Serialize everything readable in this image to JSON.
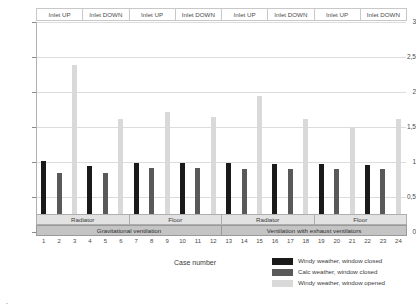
{
  "chart_data": {
    "type": "bar",
    "title": "",
    "xlabel": "Case number",
    "ylabel": "ε̄r [-]",
    "ylim": [
      0,
      3
    ],
    "ytick_labels": [
      "0",
      "0,5",
      "1",
      "1,5",
      "2",
      "2,5",
      "3"
    ],
    "ytick_values": [
      0,
      0.5,
      1,
      1.5,
      2,
      2.5,
      3
    ],
    "grid": true,
    "legend_position": "bottom-right",
    "categories": [
      "1",
      "2",
      "3",
      "4",
      "5",
      "6",
      "7",
      "8",
      "9",
      "10",
      "11",
      "12",
      "13",
      "14",
      "15",
      "16",
      "17",
      "18",
      "19",
      "20",
      "21",
      "22",
      "23",
      "24"
    ],
    "series": [
      {
        "name": "Windy weather, window closed",
        "color": "#1a1a1a",
        "values": [
          1.02,
          null,
          null,
          0.95,
          null,
          null,
          0.98,
          null,
          null,
          0.99,
          null,
          null,
          0.98,
          null,
          null,
          0.97,
          null,
          null,
          0.97,
          null,
          null,
          0.96,
          null,
          null
        ]
      },
      {
        "name": "Calc weather, window closed",
        "color": "#595959",
        "values": [
          null,
          0.84,
          null,
          null,
          0.84,
          null,
          null,
          0.92,
          null,
          null,
          0.92,
          null,
          null,
          0.9,
          null,
          null,
          0.9,
          null,
          null,
          0.9,
          null,
          null,
          0.9,
          null
        ]
      },
      {
        "name": "Windy weather, window opened",
        "color": "#d9d9d9",
        "values": [
          null,
          null,
          2.38,
          null,
          null,
          1.62,
          null,
          null,
          1.72,
          null,
          null,
          1.64,
          null,
          null,
          1.94,
          null,
          null,
          1.62,
          null,
          null,
          1.5,
          null,
          null,
          1.62
        ]
      }
    ],
    "bar_values_by_case": [
      1.02,
      0.84,
      2.38,
      0.95,
      0.84,
      1.62,
      0.98,
      0.92,
      1.72,
      0.99,
      0.92,
      1.64,
      0.98,
      0.9,
      1.94,
      0.97,
      0.9,
      1.62,
      0.97,
      0.9,
      1.5,
      0.96,
      0.9,
      1.62
    ],
    "bar_series_index_by_case": [
      0,
      1,
      2,
      0,
      1,
      2,
      0,
      1,
      2,
      0,
      1,
      2,
      0,
      1,
      2,
      0,
      1,
      2,
      0,
      1,
      2,
      0,
      1,
      2
    ]
  },
  "header_band": {
    "cells": [
      {
        "label": "Inlet UP"
      },
      {
        "label": "Inlet DOWN"
      },
      {
        "label": "Inlet UP"
      },
      {
        "label": "Inlet DOWN"
      },
      {
        "label": "Inlet UP"
      },
      {
        "label": "Inlet DOWN"
      },
      {
        "label": "Inlet UP"
      },
      {
        "label": "Inlet DOWN"
      }
    ]
  },
  "heating_band": {
    "cells": [
      {
        "label": "Radiator"
      },
      {
        "label": "Floor"
      },
      {
        "label": "Radiator"
      },
      {
        "label": "Floor"
      }
    ]
  },
  "ventilation_band": {
    "cells": [
      {
        "label": "Gravitational ventilation"
      },
      {
        "label": "Ventilation with exhaust ventilators"
      }
    ]
  },
  "legend": {
    "items": [
      {
        "label": "Windy weather, window closed",
        "color": "#1a1a1a"
      },
      {
        "label": "Calc weather, window closed",
        "color": "#595959"
      },
      {
        "label": "Windy weather, window opened",
        "color": "#d9d9d9"
      }
    ]
  },
  "axis": {
    "x_title": "Case number",
    "y_title_main": "ε",
    "y_title_sub": "r",
    "y_title_unit": "[-]"
  },
  "caption_sliver": "̵̵̵̵̵̵̵̵̵̵"
}
